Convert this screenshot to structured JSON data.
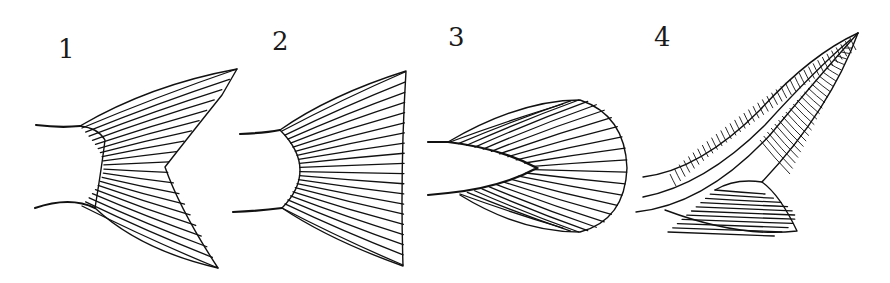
{
  "figure": {
    "ink_color": "#111111",
    "background": "#ffffff",
    "panels": [
      {
        "label": "1",
        "shape": "forked"
      },
      {
        "label": "2",
        "shape": "truncate"
      },
      {
        "label": "3",
        "shape": "rounded"
      },
      {
        "label": "4",
        "shape": "heterocercal"
      }
    ]
  }
}
